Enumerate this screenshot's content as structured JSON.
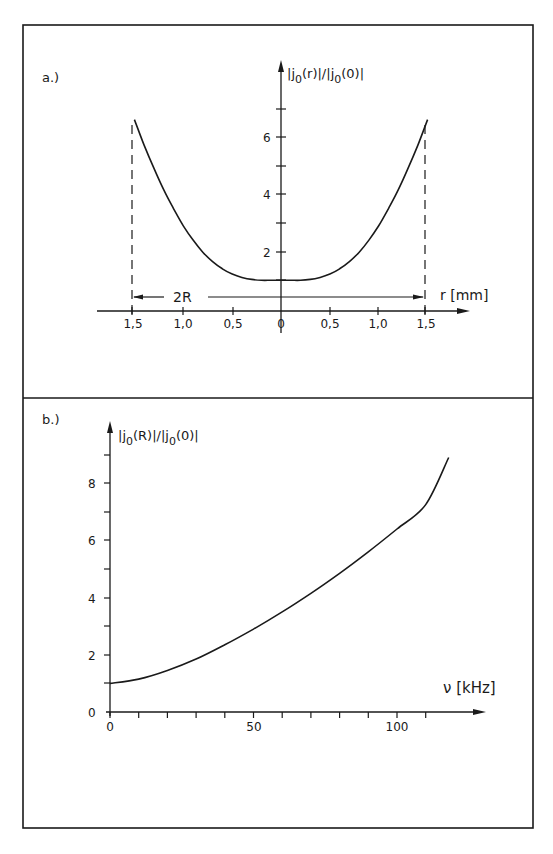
{
  "chart_data": [
    {
      "panel": "a.)",
      "type": "line",
      "title": "",
      "ylabel": "|j0(r)|/|j0(0)|",
      "xlabel": "r [mm]",
      "x_ticks": [
        "1,5",
        "1,0",
        "0,5",
        "0",
        "0,5",
        "1,0",
        "1,5"
      ],
      "x_tick_values": [
        -1.5,
        -1.0,
        -0.5,
        0,
        0.5,
        1.0,
        1.5
      ],
      "y_ticks_labeled": [
        "2",
        "4",
        "6"
      ],
      "y_tick_values": [
        1,
        2,
        3,
        4,
        5,
        6,
        7
      ],
      "xlim": [
        -1.85,
        1.9
      ],
      "ylim": [
        0,
        8
      ],
      "annotation": "2R",
      "dashed_lines_at_x": [
        -1.5,
        1.5
      ],
      "grid": false,
      "series": [
        {
          "name": "|j0(r)|/|j0(0)|",
          "x": [
            -1.5,
            -1.4,
            -1.3,
            -1.2,
            -1.1,
            -1.0,
            -0.9,
            -0.8,
            -0.7,
            -0.6,
            -0.5,
            -0.4,
            -0.3,
            -0.2,
            -0.1,
            0,
            0.1,
            0.2,
            0.3,
            0.4,
            0.5,
            0.6,
            0.7,
            0.8,
            0.9,
            1.0,
            1.1,
            1.2,
            1.3,
            1.4,
            1.5
          ],
          "y": [
            6.6,
            5.7,
            4.9,
            4.15,
            3.5,
            2.9,
            2.4,
            1.98,
            1.65,
            1.4,
            1.22,
            1.1,
            1.03,
            1.0,
            1.0,
            1.0,
            1.0,
            1.0,
            1.03,
            1.1,
            1.22,
            1.4,
            1.65,
            1.98,
            2.4,
            2.9,
            3.5,
            4.15,
            4.9,
            5.7,
            6.6
          ]
        }
      ]
    },
    {
      "panel": "b.)",
      "type": "line",
      "title": "",
      "ylabel": "|j0(R)|/|j0(0)|",
      "xlabel": "ν [kHz]",
      "x_ticks": [
        "0",
        "50",
        "100"
      ],
      "x_tick_values": [
        0,
        10,
        20,
        30,
        40,
        50,
        60,
        70,
        80,
        90,
        100,
        110
      ],
      "y_ticks": [
        "0",
        "2",
        "4",
        "6",
        "8"
      ],
      "y_tick_values": [
        0,
        1,
        2,
        3,
        4,
        5,
        6,
        7,
        8,
        9
      ],
      "xlim": [
        0,
        131
      ],
      "ylim": [
        0,
        10
      ],
      "grid": false,
      "series": [
        {
          "name": "|j0(R)|/|j0(0)|",
          "x": [
            0,
            10,
            20,
            30,
            40,
            50,
            60,
            70,
            80,
            90,
            100,
            110,
            118
          ],
          "y": [
            1.0,
            1.15,
            1.45,
            1.85,
            2.35,
            2.9,
            3.5,
            4.15,
            4.85,
            5.6,
            6.4,
            7.25,
            8.9
          ]
        }
      ]
    }
  ],
  "labels": {
    "panel_a": "a.)",
    "panel_b": "b.)",
    "a_ylabel_main": "|j",
    "a_ylabel_sub": "0",
    "a_ylabel_mid": "(r)|/|j",
    "a_ylabel_sub2": "0",
    "a_ylabel_end": "(0)|",
    "b_ylabel_main": "|j",
    "b_ylabel_sub": "0",
    "b_ylabel_mid": "(R)|/|j",
    "b_ylabel_sub2": "0",
    "b_ylabel_end": "(0)|",
    "a_xlabel": "r [mm]",
    "b_xlabel": "ν [kHz]",
    "two_r": "2R",
    "a_xtick_0": "1,5",
    "a_xtick_1": "1,0",
    "a_xtick_2": "0,5",
    "a_xtick_3": "0",
    "a_xtick_4": "0,5",
    "a_xtick_5": "1,0",
    "a_xtick_6": "1,5",
    "a_ytick_2": "2",
    "a_ytick_4": "4",
    "a_ytick_6": "6",
    "b_ytick_0": "0",
    "b_ytick_2": "2",
    "b_ytick_4": "4",
    "b_ytick_6": "6",
    "b_ytick_8": "8",
    "b_xtick_0": "0",
    "b_xtick_50": "50",
    "b_xtick_100": "100"
  },
  "colors": {
    "ink": "#1a1a1a",
    "paper": "#ffffff"
  }
}
